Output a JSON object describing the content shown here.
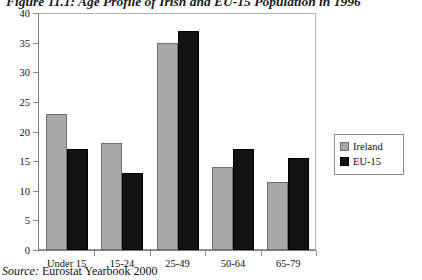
{
  "figure": {
    "title": "Figure 11.1: Age Profile of Irish and EU-15 Population in 1996",
    "source_label": "Source:",
    "source_value": " Eurostat Yearbook 2000"
  },
  "legend": {
    "position": "right",
    "entries": [
      {
        "label": "Ireland",
        "color": "#a9a9a9",
        "swatch": "ireland"
      },
      {
        "label": "EU-15",
        "color": "#121212",
        "swatch": "eu"
      }
    ]
  },
  "chart_data": {
    "type": "bar",
    "title": "Figure 11.1: Age Profile of Irish and EU-15 Population in 1996",
    "xlabel": "",
    "ylabel": "",
    "categories": [
      "Under 15",
      "15-24",
      "25-49",
      "50-64",
      "65-79"
    ],
    "series": [
      {
        "name": "Ireland",
        "color": "#a9a9a9",
        "values": [
          23,
          18,
          35,
          14,
          11.5
        ]
      },
      {
        "name": "EU-15",
        "color": "#121212",
        "values": [
          17,
          13,
          37,
          17,
          15.5
        ]
      }
    ],
    "ylim": [
      0,
      40
    ],
    "yticks": [
      0,
      5,
      10,
      15,
      20,
      25,
      30,
      35,
      40
    ],
    "ytick_labels": [
      "0",
      "5",
      "10",
      "15",
      "20",
      "25",
      "30",
      "35",
      "40"
    ],
    "grid": false,
    "legend_position": "right"
  }
}
